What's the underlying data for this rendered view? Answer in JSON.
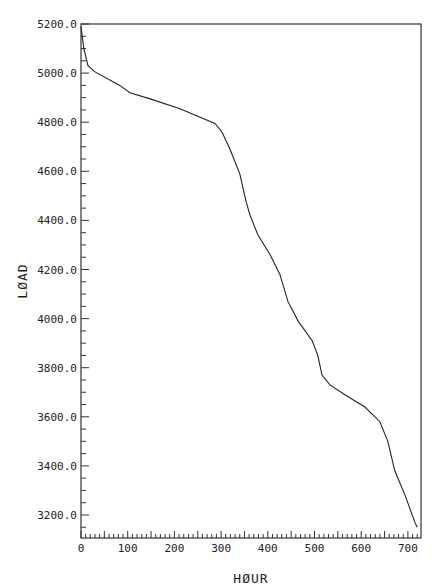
{
  "chart_data": {
    "type": "line",
    "title": "",
    "xlabel": "HØUR",
    "ylabel": "LØAD",
    "xlim": [
      0,
      750
    ],
    "ylim": [
      3100,
      5200
    ],
    "grid": false,
    "legend": null,
    "x_ticks": [
      0,
      100,
      200,
      300,
      400,
      500,
      600,
      700
    ],
    "x_tick_labels": [
      "0",
      "100",
      "200",
      "300",
      "400",
      "500",
      "600",
      "700"
    ],
    "y_ticks": [
      3200,
      3400,
      3600,
      3800,
      4000,
      4200,
      4400,
      4600,
      4800,
      5000,
      5200
    ],
    "y_tick_labels": [
      "3200.0",
      "3400.0",
      "3600.0",
      "3800.0",
      "4000.0",
      "4200.0",
      "4400.0",
      "4600.0",
      "4800.0",
      "5000.0",
      "5200.0"
    ],
    "series": [
      {
        "name": "load duration",
        "x": [
          0,
          6,
          15,
          30,
          83,
          105,
          148,
          212,
          255,
          287,
          302,
          319,
          340,
          353,
          362,
          379,
          405,
          426,
          443,
          465,
          495,
          507,
          516,
          533,
          565,
          608,
          640,
          657,
          672,
          694,
          715,
          720
        ],
        "values": [
          5190,
          5100,
          5030,
          5005,
          4950,
          4920,
          4895,
          4855,
          4820,
          4795,
          4760,
          4690,
          4590,
          4480,
          4420,
          4340,
          4260,
          4180,
          4070,
          3990,
          3910,
          3850,
          3770,
          3730,
          3690,
          3640,
          3580,
          3500,
          3380,
          3280,
          3170,
          3150
        ]
      }
    ]
  }
}
